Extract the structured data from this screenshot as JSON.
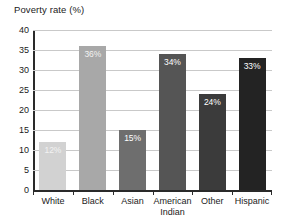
{
  "chart_data": {
    "type": "bar",
    "title": "Poverty rate (%)",
    "xlabel": "",
    "ylabel": "",
    "categories": [
      "White",
      "Black",
      "Asian",
      "American Indian",
      "Other",
      "Hispanic"
    ],
    "values": [
      12,
      36,
      15,
      34,
      24,
      33
    ],
    "data_labels": [
      "12%",
      "36%",
      "15%",
      "34%",
      "24%",
      "33%"
    ],
    "ylim": [
      0,
      40
    ],
    "ytick_labels": [
      "40",
      "35",
      "30",
      "25",
      "20",
      "15",
      "10",
      "5",
      "0"
    ],
    "ytick_values": [
      40,
      35,
      30,
      25,
      20,
      15,
      10,
      5,
      0
    ],
    "grid": true,
    "legend": false,
    "bar_colors": [
      "#d2d2d2",
      "#a8a8a8",
      "#6e6e6e",
      "#555555",
      "#3b3b3b",
      "#232323"
    ],
    "axis_color": "#2a2a2a",
    "gridline_color": "#c9c9c9",
    "label_text_color": "#ffffff",
    "background": "#ffffff"
  }
}
